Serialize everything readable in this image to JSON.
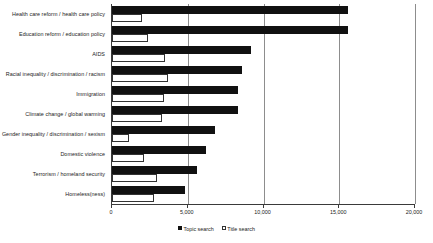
{
  "chart_data": {
    "type": "bar",
    "orientation": "horizontal",
    "title": "",
    "xlabel": "",
    "ylabel": "",
    "xlim": [
      0,
      20000
    ],
    "grid": true,
    "legend_position": "bottom",
    "xticks": [
      {
        "value": 0,
        "label": "0"
      },
      {
        "value": 5000,
        "label": "5,000"
      },
      {
        "value": 10000,
        "label": "10,000"
      },
      {
        "value": 15000,
        "label": "15,000"
      },
      {
        "value": 20000,
        "label": "20,000"
      }
    ],
    "categories": [
      "Health care reform / health care policy",
      "Education reform / education policy",
      "AIDS",
      "Racial inequality / discrimination / racism",
      "Immigration",
      "Climate change / global warming",
      "Gender inequality / discrimination / sexism",
      "Domestic violence",
      "Terrorism / homeland security",
      "Homeless(ness)"
    ],
    "series": [
      {
        "name": "Topic search",
        "color": "#111111",
        "values": [
          15600,
          15600,
          9200,
          8600,
          8300,
          8300,
          6800,
          6200,
          5600,
          4800
        ]
      },
      {
        "name": "Title search",
        "color": "#ffffff",
        "values": [
          2000,
          2400,
          3500,
          3700,
          3400,
          3300,
          1100,
          2100,
          3000,
          2800
        ]
      }
    ]
  }
}
